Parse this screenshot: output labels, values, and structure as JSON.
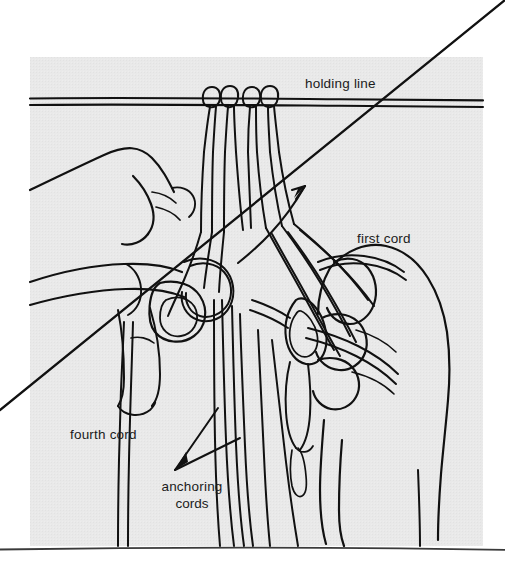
{
  "figure": {
    "domain": "instructional-illustration",
    "technique": "mounting cords on a holding line with lark's head knots",
    "panel": {
      "background_color": "#e9e9e9",
      "page_background_color": "#ffffff",
      "ink_color": "#111111",
      "x": 30,
      "y": 57,
      "width": 453,
      "height": 489
    },
    "baseline_rule": {
      "name": "bottom-rule",
      "color": "#3a3a3a",
      "y": 548
    }
  },
  "labels": {
    "holding_line": "holding line",
    "first_cord": "first cord",
    "fourth_cord": "fourth cord",
    "anchoring_cords_line1": "anchoring",
    "anchoring_cords_line2": "cords"
  },
  "annotations": {
    "pointer_first_cord": "arrow pointing up-right toward the working first cord",
    "pointer_anchoring_cords": "double leader arrow pointing down-left from the two anchoring cords"
  },
  "elements": {
    "holding_line_name": "holding-line",
    "knots": [
      {
        "name": "larks-head-knot-left"
      },
      {
        "name": "larks-head-knot-right"
      }
    ],
    "hands": [
      {
        "name": "left-hand"
      },
      {
        "name": "right-hand"
      }
    ],
    "diagonal_cord_name": "first-cord-diagonal"
  }
}
